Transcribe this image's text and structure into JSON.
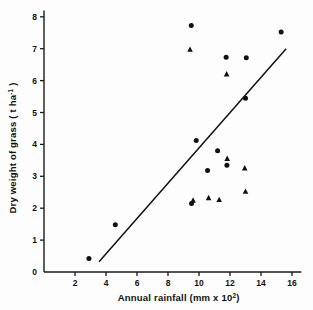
{
  "chart_data": {
    "type": "scatter",
    "title": "",
    "xlabel": "Annual  rainfall (mm x 10",
    "xlabel_exponent": "2",
    "xlabel_suffix": ")",
    "ylabel": "Dry weight of grass ( t ha",
    "ylabel_exponent": "-1",
    "ylabel_suffix": " )",
    "xlim": [
      0,
      16.6
    ],
    "ylim": [
      0,
      8.2
    ],
    "xticks": [
      2,
      4,
      6,
      8,
      10,
      12,
      14,
      16
    ],
    "yticks": [
      0,
      1,
      2,
      3,
      4,
      5,
      6,
      7,
      8
    ],
    "xtick_labels": [
      "2",
      "4",
      "6",
      "8",
      "10",
      "12",
      "14",
      "16"
    ],
    "ytick_labels": [
      "0",
      "1",
      "2",
      "3",
      "4",
      "5",
      "6",
      "7",
      "8"
    ],
    "grid": false,
    "legend": "none",
    "marker_color": "#111111",
    "series": [
      {
        "name": "circle-points",
        "marker": "circle",
        "points": [
          [
            2.9,
            0.42
          ],
          [
            4.6,
            1.48
          ],
          [
            9.5,
            7.73
          ],
          [
            9.82,
            4.12
          ],
          [
            9.52,
            2.15
          ],
          [
            10.55,
            3.18
          ],
          [
            11.2,
            3.8
          ],
          [
            11.75,
            6.73
          ],
          [
            11.8,
            3.35
          ],
          [
            13.05,
            6.72
          ],
          [
            13.0,
            5.45
          ],
          [
            15.3,
            7.52
          ]
        ]
      },
      {
        "name": "triangle-points",
        "marker": "triangle",
        "points": [
          [
            9.42,
            6.97
          ],
          [
            9.62,
            2.24
          ],
          [
            10.62,
            2.32
          ],
          [
            11.3,
            2.26
          ],
          [
            11.78,
            6.2
          ],
          [
            11.82,
            3.55
          ],
          [
            12.95,
            3.25
          ],
          [
            13.0,
            2.52
          ]
        ]
      }
    ],
    "regression_line": {
      "name": "fitted-line",
      "x_start": 3.55,
      "y_start": 0.32,
      "x_end": 15.62,
      "y_end": 7.0
    }
  }
}
